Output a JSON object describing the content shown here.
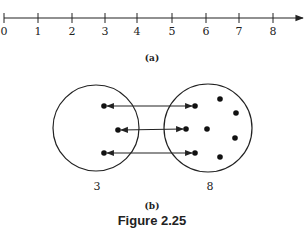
{
  "part_a": {
    "caption": "(a)",
    "number_line": {
      "tick_labels": [
        "0",
        "1",
        "2",
        "3",
        "4",
        "5",
        "6",
        "7",
        "8"
      ],
      "tick_x": [
        4,
        38,
        72,
        105,
        137,
        172,
        206,
        239,
        273
      ],
      "line_y": 18,
      "arrow_end_x": 303
    }
  },
  "part_b": {
    "caption": "(b)",
    "left_set": {
      "label": "3",
      "cx": 96,
      "cy": 128,
      "r": 43,
      "points": [
        [
          104,
          106
        ],
        [
          118,
          130
        ],
        [
          104,
          153
        ]
      ]
    },
    "right_set": {
      "label": "8",
      "cx": 208,
      "cy": 128,
      "r": 44,
      "points": [
        [
          195,
          106
        ],
        [
          186,
          129
        ],
        [
          195,
          153
        ],
        [
          207,
          129
        ],
        [
          220,
          99
        ],
        [
          236,
          113
        ],
        [
          235,
          138
        ],
        [
          220,
          157
        ]
      ]
    },
    "mappings": [
      [
        [
          104,
          106
        ],
        [
          195,
          106
        ]
      ],
      [
        [
          118,
          130
        ],
        [
          186,
          129
        ]
      ],
      [
        [
          104,
          153
        ],
        [
          195,
          153
        ]
      ]
    ]
  },
  "figure_title": "Figure 2.25"
}
